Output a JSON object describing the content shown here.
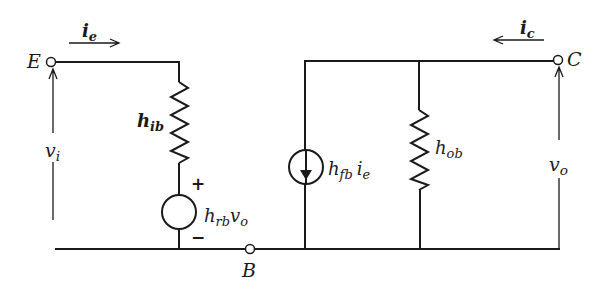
{
  "diagram": {
    "type": "circuit",
    "nodes": {
      "emitter": {
        "label": "E"
      },
      "collector": {
        "label": "C"
      },
      "base": {
        "label": "B"
      }
    },
    "currents": {
      "input": {
        "symbol": "i",
        "subscript": "e",
        "direction": "right"
      },
      "output": {
        "symbol": "i",
        "subscript": "c",
        "direction": "left"
      }
    },
    "voltages": {
      "input": {
        "symbol": "v",
        "subscript": "i"
      },
      "output": {
        "symbol": "v",
        "subscript": "o"
      }
    },
    "components": {
      "input_resistor": {
        "symbol": "h",
        "subscript": "ib",
        "kind": "resistor"
      },
      "voltage_source": {
        "symbol": "h",
        "subscript": "rb",
        "suffix": "v",
        "suffix_subscript": "o",
        "kind": "dependent-voltage-source",
        "plus": "+",
        "minus": "−"
      },
      "current_source": {
        "symbol": "h",
        "subscript": "fb",
        "suffix": "i",
        "suffix_subscript": "e",
        "kind": "dependent-current-source",
        "arrow": "down"
      },
      "output_resistor": {
        "symbol": "h",
        "subscript": "ob",
        "kind": "resistor"
      }
    },
    "colors": {
      "wire": "#1a1a1a",
      "background": "#ffffff"
    }
  }
}
